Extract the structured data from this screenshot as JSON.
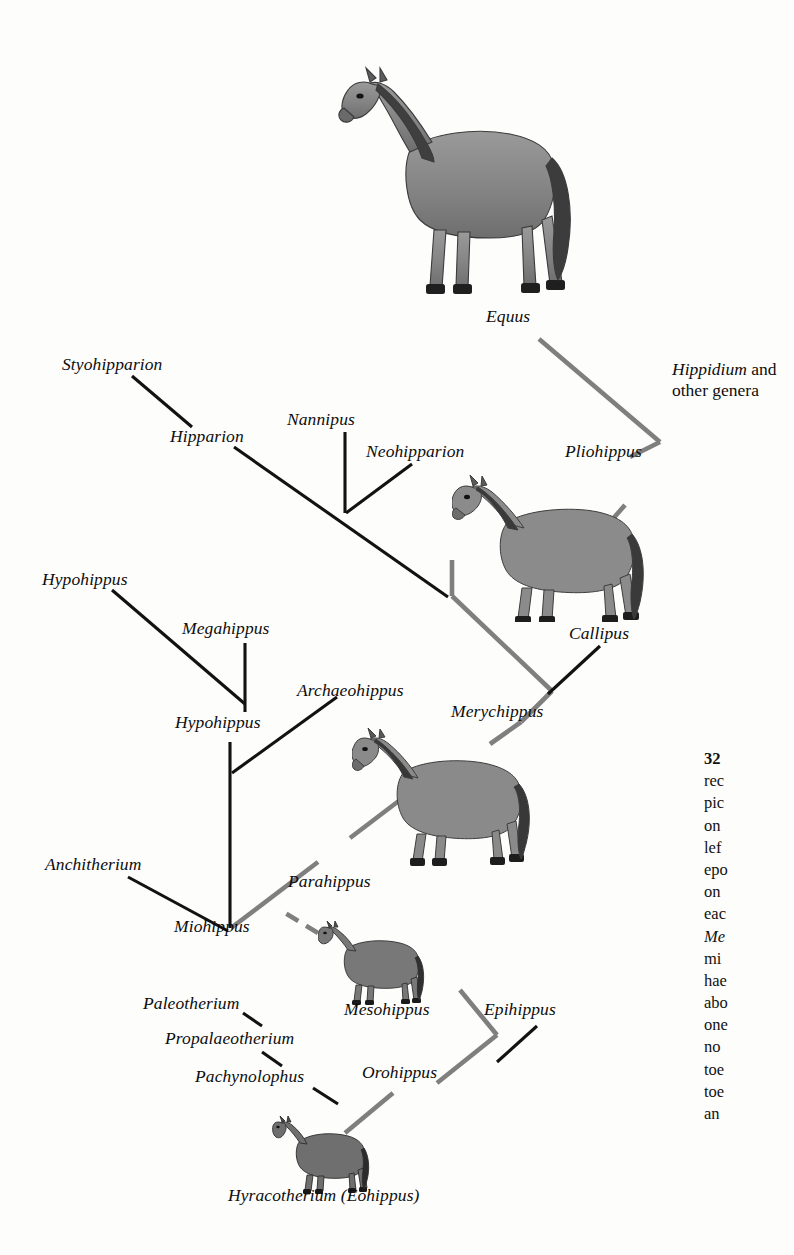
{
  "figure": {
    "type": "cladogram",
    "background_color": "#fdfdfc",
    "main_lineage_color": "#7f7f7f",
    "branch_color": "#111111"
  },
  "taxa": {
    "equus": "Equus",
    "hippidium_italic": "Hippidium",
    "hippidium_roman": " and",
    "hippidium_line2": "other genera",
    "styohipparion": "Styohipparion",
    "nannipus": "Nannipus",
    "hipparion": "Hipparion",
    "neohipparion": "Neohipparion",
    "pliohippus": "Pliohippus",
    "hypohippus_upper": "Hypohippus",
    "megahippus": "Megahippus",
    "callipus": "Callipus",
    "archaeohippus": "Archaeohippus",
    "hypohippus_node": "Hypohippus",
    "merychippus": "Merychippus",
    "anchitherium": "Anchitherium",
    "parahippus": "Parahippus",
    "miohippus": "Miohippus",
    "paleotherium": "Paleotherium",
    "mesohippus": "Mesohippus",
    "epihippus": "Epihippus",
    "propalaeotherium": "Propalaeotherium",
    "pachynolophus": "Pachynolophus",
    "orohippus": "Orohippus",
    "hyracotherium": "Hyracotherium (Eohippus)"
  },
  "illustrations": {
    "equus_horse": "horse-illustration-equus",
    "pliohippus_horse": "horse-illustration-pliohippus",
    "merychippus_horse": "horse-illustration-merychippus",
    "mesohippus_horse": "horse-illustration-mesohippus",
    "hyracotherium_horse": "horse-illustration-hyracotherium"
  },
  "caption": {
    "lines": [
      "32",
      "rec",
      "pic",
      "on",
      "lef",
      "epo",
      "on",
      "eac",
      "Me",
      "mi",
      "hae",
      "abo",
      "one",
      "no",
      "toe",
      "toe",
      "an"
    ],
    "italic_line_index": 8,
    "note": "caption column is cropped at the right edge of the page"
  },
  "chart_data": {
    "type": "diagram-tree",
    "nodes": [
      {
        "name": "Hyracotherium (Eohippus)",
        "x": 310,
        "y": 1196,
        "role": "root"
      },
      {
        "name": "Orohippus",
        "x": 430,
        "y": 1078,
        "role": "lineage"
      },
      {
        "name": "Epihippus",
        "x": 540,
        "y": 1020,
        "role": "terminal"
      },
      {
        "name": "Mesohippus",
        "x": 400,
        "y": 1010,
        "role": "lineage"
      },
      {
        "name": "Pachynolophus",
        "x": 300,
        "y": 1080,
        "role": "terminal"
      },
      {
        "name": "Propalaeotherium",
        "x": 280,
        "y": 1042,
        "role": "terminal"
      },
      {
        "name": "Paleotherium",
        "x": 240,
        "y": 1007,
        "role": "terminal"
      },
      {
        "name": "Miohippus",
        "x": 230,
        "y": 930,
        "role": "lineage"
      },
      {
        "name": "Anchitherium",
        "x": 90,
        "y": 870,
        "role": "terminal"
      },
      {
        "name": "Parahippus",
        "x": 300,
        "y": 888,
        "role": "lineage"
      },
      {
        "name": "Hypohippus",
        "x": 230,
        "y": 728,
        "role": "node"
      },
      {
        "name": "Archaeohippus",
        "x": 355,
        "y": 700,
        "role": "terminal"
      },
      {
        "name": "Megahippus",
        "x": 245,
        "y": 630,
        "role": "terminal"
      },
      {
        "name": "Hypohippus",
        "x": 95,
        "y": 583,
        "role": "terminal"
      },
      {
        "name": "Merychippus",
        "x": 500,
        "y": 716,
        "role": "lineage"
      },
      {
        "name": "Callipus",
        "x": 600,
        "y": 638,
        "role": "terminal"
      },
      {
        "name": "Pliohippus",
        "x": 610,
        "y": 456,
        "role": "lineage"
      },
      {
        "name": "Neohipparion",
        "x": 430,
        "y": 455,
        "role": "terminal"
      },
      {
        "name": "Nannipus",
        "x": 345,
        "y": 424,
        "role": "terminal"
      },
      {
        "name": "Hipparion",
        "x": 230,
        "y": 440,
        "role": "node"
      },
      {
        "name": "Styohipparion",
        "x": 120,
        "y": 368,
        "role": "terminal"
      },
      {
        "name": "Equus",
        "x": 520,
        "y": 320,
        "role": "lineage"
      },
      {
        "name": "Hippidium and other genera",
        "x": 672,
        "y": 372,
        "role": "terminal"
      }
    ]
  }
}
